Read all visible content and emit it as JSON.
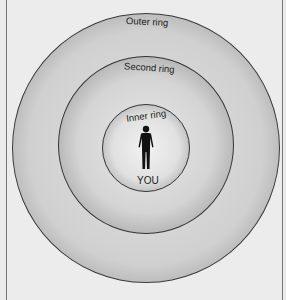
{
  "diagram": {
    "rings": [
      {
        "id": "outer",
        "label": "Outer ring"
      },
      {
        "id": "second",
        "label": "Second ring"
      },
      {
        "id": "inner",
        "label": "Inner ring"
      }
    ],
    "center_label": "YOU",
    "center_icon": "person-silhouette-icon"
  }
}
